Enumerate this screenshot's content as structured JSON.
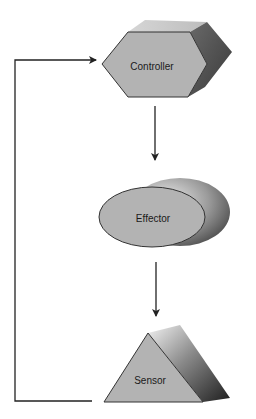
{
  "diagram": {
    "type": "feedback-loop",
    "nodes": [
      {
        "id": "controller",
        "label": "Controller",
        "shape": "hexagonal-prism"
      },
      {
        "id": "effector",
        "label": "Effector",
        "shape": "elliptical-cylinder"
      },
      {
        "id": "sensor",
        "label": "Sensor",
        "shape": "triangular-prism"
      }
    ],
    "edges": [
      {
        "from": "controller",
        "to": "effector"
      },
      {
        "from": "effector",
        "to": "sensor"
      },
      {
        "from": "sensor",
        "to": "controller",
        "kind": "feedback"
      }
    ],
    "colors": {
      "face": "#b3b3b3",
      "top": "#c9c9c9",
      "side_dark": "#4a4a4a",
      "side_light": "#e6e6e6",
      "outline": "#333333",
      "arrow": "#222222"
    }
  }
}
